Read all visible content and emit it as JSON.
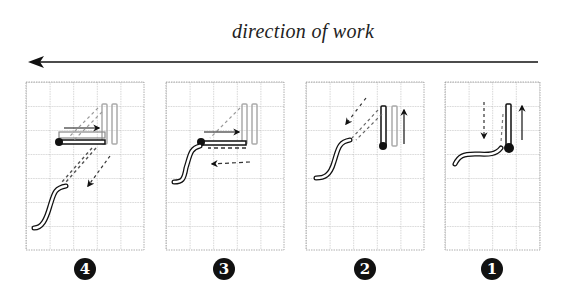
{
  "title": "direction of work",
  "direction_arrow": {
    "points": "left"
  },
  "colors": {
    "ink": "#111111",
    "grid": "#9a9a9a",
    "faded": "#bdbdbd"
  },
  "panels": [
    {
      "step": 4,
      "label": "❹",
      "columns": 5,
      "rows": 7
    },
    {
      "step": 3,
      "label": "❸",
      "columns": 5,
      "rows": 7
    },
    {
      "step": 2,
      "label": "❷",
      "columns": 5,
      "rows": 7
    },
    {
      "step": 1,
      "label": "❶",
      "columns": 4,
      "rows": 7
    }
  ]
}
